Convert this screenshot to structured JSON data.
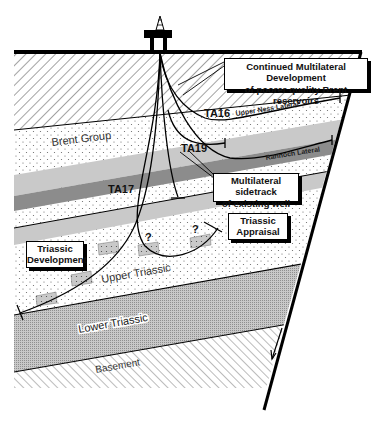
{
  "diagram": {
    "type": "geological cross-section",
    "platform": {
      "icon": "offshore-platform-icon"
    },
    "layers": [
      {
        "id": "overburden",
        "pattern": "diagonal-hatch"
      },
      {
        "id": "brent-group",
        "label": "Brent Group",
        "pattern": "dots"
      },
      {
        "id": "upper-triassic",
        "label": "Upper Triassic",
        "pattern": "dots"
      },
      {
        "id": "lower-triassic",
        "label": "Lower Triassic",
        "pattern": "fine-grid"
      },
      {
        "id": "basement",
        "label": "Basement",
        "pattern": "diagonal-hatch-reverse"
      }
    ],
    "wells": [
      {
        "id": "TA16",
        "label": "TA16",
        "lateral_label": "Upper Ness Lateral"
      },
      {
        "id": "TA19",
        "label": "TA19",
        "lateral_label": "Rannoch Lateral"
      },
      {
        "id": "TA17",
        "label": "TA17"
      }
    ],
    "unknown_marker": "?",
    "callouts": {
      "brent": {
        "line1": "Continued Multilateral Development",
        "line2": "of poorer quality Brent reservoirs"
      },
      "sidetrack": {
        "line1": "Multilateral sidetrack",
        "line2": "of existing well"
      },
      "appraisal": {
        "line1": "Triassic",
        "line2": "Appraisal"
      },
      "development": {
        "line1": "Triassic",
        "line2": "Development"
      }
    },
    "colors": {
      "line": "#000000",
      "light_band": "#c9c9c9",
      "dark_band": "#8c8c8c",
      "background": "#ffffff"
    }
  }
}
